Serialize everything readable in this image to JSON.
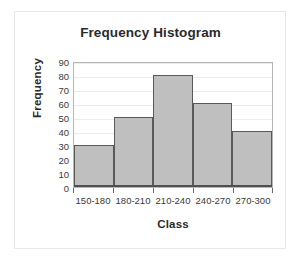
{
  "chart_data": {
    "type": "bar",
    "title": "Frequency Histogram",
    "xlabel": "Class",
    "ylabel": "Frequency",
    "categories": [
      "150-180",
      "180-210",
      "210-240",
      "240-270",
      "270-300"
    ],
    "values": [
      30,
      50,
      80,
      60,
      40
    ],
    "ylim": [
      0,
      90
    ],
    "ytick_step": 10,
    "yticks": [
      90,
      80,
      70,
      60,
      50,
      40,
      30,
      20,
      10,
      0
    ],
    "grid": true,
    "legend": false,
    "series": [
      {
        "name": "Frequency",
        "values": [
          30,
          50,
          80,
          60,
          40
        ]
      }
    ],
    "colors": {
      "bar_fill": "#bfbfbf",
      "bar_border": "#595959",
      "plot_border": "#b5b5b5",
      "gridline": "#ececec",
      "axis": "#4f4f4f",
      "text": "#2b2b2b",
      "tick_text": "#3a3a3a",
      "background": "#ffffff",
      "outer_frame": "#e9e9e9"
    }
  }
}
